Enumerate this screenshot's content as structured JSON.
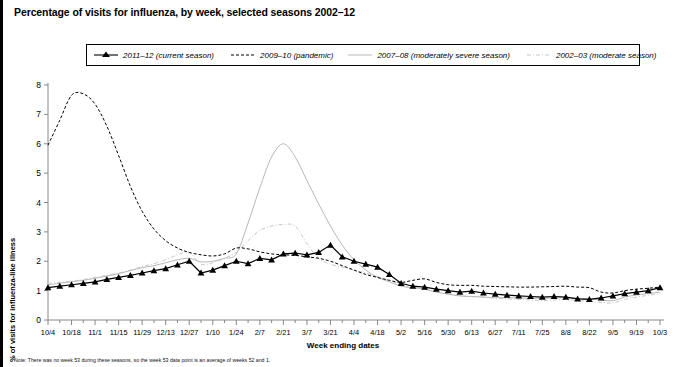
{
  "chart_data": {
    "type": "line",
    "title": "Percentage of visits for influenza, by week, selected seasons 2002–12",
    "xlabel": "Week ending dates",
    "ylabel": "% of visits for influenza-like illness",
    "ylim": [
      0,
      8
    ],
    "yticks": [
      0,
      1,
      2,
      3,
      4,
      5,
      6,
      7,
      8
    ],
    "grid": false,
    "legend_position": "top",
    "note": "Note: There was no week 53 during these seasons, so the week 53 data point is an average of weeks 52 and 1.",
    "categories": [
      "10/4",
      "10/11",
      "10/18",
      "10/25",
      "11/1",
      "11/8",
      "11/15",
      "11/22",
      "11/29",
      "12/6",
      "12/13",
      "12/20",
      "12/27",
      "1/3",
      "1/10",
      "1/17",
      "1/24",
      "1/31",
      "2/7",
      "2/14",
      "2/21",
      "2/28",
      "3/7",
      "3/14",
      "3/21",
      "3/28",
      "4/4",
      "4/11",
      "4/18",
      "4/25",
      "5/2",
      "5/9",
      "5/16",
      "5/23",
      "5/30",
      "6/6",
      "6/13",
      "6/20",
      "6/27",
      "7/4",
      "7/11",
      "7/18",
      "7/25",
      "8/1",
      "8/8",
      "8/15",
      "8/22",
      "8/29",
      "9/5",
      "9/12",
      "9/19",
      "9/26",
      "10/3"
    ],
    "xticks": [
      "10/4",
      "10/18",
      "11/1",
      "11/15",
      "11/29",
      "12/13",
      "12/27",
      "1/10",
      "1/24",
      "2/7",
      "2/21",
      "3/7",
      "3/21",
      "4/4",
      "4/18",
      "5/2",
      "5/16",
      "5/30",
      "6/13",
      "6/27",
      "7/11",
      "7/25",
      "8/8",
      "8/22",
      "9/5",
      "9/19",
      "10/3"
    ],
    "series": [
      {
        "name": "2011–12 (current season)",
        "style": "solid-marker",
        "color": "#000000",
        "marker": "triangle",
        "values": [
          1.1,
          1.15,
          1.2,
          1.25,
          1.3,
          1.38,
          1.45,
          1.52,
          1.6,
          1.68,
          1.75,
          1.88,
          2.0,
          1.6,
          1.7,
          1.85,
          2.0,
          1.92,
          2.1,
          2.05,
          2.25,
          2.28,
          2.22,
          2.3,
          2.55,
          2.15,
          2.0,
          1.9,
          1.8,
          1.55,
          1.25,
          1.15,
          1.12,
          1.05,
          1.0,
          0.95,
          0.98,
          0.92,
          0.88,
          0.85,
          0.82,
          0.8,
          0.78,
          0.8,
          0.78,
          0.72,
          0.7,
          0.75,
          0.82,
          0.9,
          0.95,
          1.0,
          1.1
        ]
      },
      {
        "name": "2009–10 (pandemic)",
        "style": "dashed",
        "color": "#000000",
        "values": [
          5.95,
          6.8,
          7.65,
          7.7,
          7.35,
          6.6,
          5.6,
          4.55,
          3.7,
          3.1,
          2.7,
          2.45,
          2.3,
          2.22,
          2.18,
          2.25,
          2.45,
          2.42,
          2.32,
          2.25,
          2.22,
          2.2,
          2.15,
          2.1,
          2.0,
          1.85,
          1.7,
          1.55,
          1.45,
          1.35,
          1.28,
          1.35,
          1.4,
          1.28,
          1.2,
          1.18,
          1.18,
          1.15,
          1.14,
          1.13,
          1.12,
          1.12,
          1.13,
          1.14,
          1.15,
          1.12,
          1.1,
          0.95,
          0.92,
          1.0,
          1.05,
          1.08,
          1.12
        ]
      },
      {
        "name": "2007–08 (moderately severe season)",
        "style": "solid",
        "color": "#b8b8b8",
        "values": [
          1.2,
          1.25,
          1.3,
          1.35,
          1.42,
          1.5,
          1.58,
          1.68,
          1.78,
          1.85,
          1.95,
          2.05,
          2.1,
          1.98,
          2.0,
          2.1,
          2.25,
          3.3,
          4.5,
          5.55,
          6.0,
          5.55,
          4.75,
          3.95,
          3.2,
          2.55,
          2.05,
          1.7,
          1.45,
          1.3,
          1.15,
          1.1,
          1.05,
          0.95,
          0.88,
          0.82,
          0.8,
          0.78,
          0.76,
          0.76,
          0.75,
          0.74,
          0.74,
          0.75,
          0.76,
          0.74,
          0.72,
          0.68,
          0.66,
          0.78,
          0.85,
          0.9,
          0.95
        ]
      },
      {
        "name": "2002–03 (moderate season)",
        "style": "dash-dot",
        "color": "#c8c8c8",
        "values": [
          1.25,
          1.28,
          1.32,
          1.38,
          1.45,
          1.52,
          1.6,
          1.7,
          1.82,
          1.92,
          2.05,
          2.22,
          2.3,
          1.9,
          1.95,
          2.1,
          2.3,
          2.7,
          3.05,
          3.2,
          3.25,
          3.2,
          2.6,
          2.1,
          1.9,
          1.8,
          1.7,
          1.6,
          1.48,
          1.35,
          1.2,
          1.1,
          1.05,
          0.95,
          0.88,
          0.82,
          0.8,
          0.78,
          0.74,
          0.72,
          0.7,
          0.68,
          0.66,
          0.68,
          0.7,
          0.66,
          0.64,
          0.6,
          0.58,
          0.7,
          0.78,
          0.84,
          0.9
        ]
      }
    ]
  },
  "legend": {
    "items": [
      {
        "label": "2011–12 (current season)"
      },
      {
        "label": "2009–10 (pandemic)"
      },
      {
        "label": "2007–08 (moderately severe season)"
      },
      {
        "label": "2002–03 (moderate season)"
      }
    ]
  }
}
